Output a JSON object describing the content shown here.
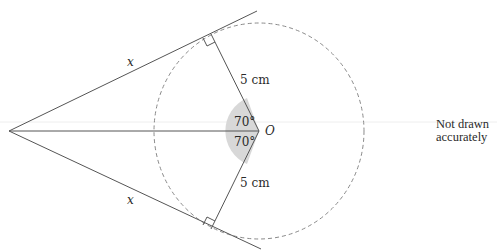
{
  "diagram": {
    "type": "geometry-tangents",
    "labels": {
      "tangent_upper": "x",
      "tangent_lower": "x",
      "radius_upper": "5 cm",
      "radius_lower": "5 cm",
      "angle_upper": "70°",
      "angle_lower": "70°",
      "center": "O"
    },
    "note": {
      "line1": "Not drawn",
      "line2": "accurately"
    },
    "colors": {
      "line": "#555555",
      "dashed_circle": "#8a8a8a",
      "angle_fill": "#d6d6d6"
    }
  }
}
